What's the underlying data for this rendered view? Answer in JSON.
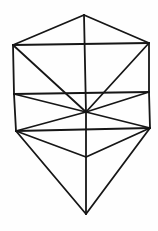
{
  "diagram": {
    "title": "",
    "background": "#fefefe",
    "stroke_color": "#161616",
    "vertices": {
      "T": [
        84,
        15
      ],
      "TL": [
        13,
        45
      ],
      "TR": [
        149,
        43
      ],
      "ML": [
        14,
        94
      ],
      "MR": [
        149,
        92
      ],
      "C": [
        86,
        112
      ],
      "BL": [
        16,
        131
      ],
      "BR": [
        150,
        128
      ],
      "LC": [
        86,
        157
      ],
      "B": [
        86,
        214
      ]
    },
    "edges": [
      [
        "T",
        "TL"
      ],
      [
        "T",
        "TR"
      ],
      [
        "TL",
        "TR"
      ],
      [
        "TL",
        "ML"
      ],
      [
        "ML",
        "BL"
      ],
      [
        "TR",
        "MR"
      ],
      [
        "MR",
        "BR"
      ],
      [
        "T",
        "C"
      ],
      [
        "C",
        "LC"
      ],
      [
        "LC",
        "B"
      ],
      [
        "TL",
        "C"
      ],
      [
        "TR",
        "C"
      ],
      [
        "ML",
        "MR"
      ],
      [
        "ML",
        "C"
      ],
      [
        "MR",
        "C"
      ],
      [
        "BL",
        "C"
      ],
      [
        "BR",
        "C"
      ],
      [
        "BL",
        "BR"
      ],
      [
        "BL",
        "LC"
      ],
      [
        "BR",
        "LC"
      ],
      [
        "BL",
        "B"
      ],
      [
        "BR",
        "B"
      ]
    ]
  }
}
